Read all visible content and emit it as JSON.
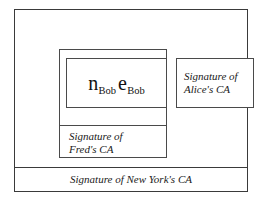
{
  "figure": {
    "name": "nested-certificate-chain",
    "background_color": "#ffffff",
    "line_color": "#3a3a3a"
  },
  "key_box": {
    "label": "Bob public key parameters",
    "terms": [
      {
        "base": "n",
        "subscript": "Bob"
      },
      {
        "base": "e",
        "subscript": "Bob"
      }
    ],
    "text": "nBob eBob"
  },
  "signatures": {
    "alice": {
      "line1": "Signature of",
      "line2": "Alice's CA",
      "full": "Signature of Alice's CA"
    },
    "fred": {
      "line1": "Signature of",
      "line2": "Fred's CA",
      "full": "Signature of Fred's CA"
    },
    "new_york": {
      "full": "Signature of New York's CA"
    }
  }
}
